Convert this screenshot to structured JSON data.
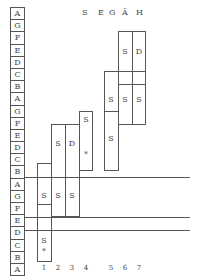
{
  "header": {
    "letters": [
      "S",
      "E",
      "G",
      "Ā",
      "H"
    ]
  },
  "pitch_labels": [
    "A",
    "G",
    "F",
    "E",
    "D",
    "C",
    "B",
    "A",
    "G",
    "F",
    "E",
    "D",
    "C",
    "B",
    "A",
    "G",
    "F",
    "E",
    "D",
    "C",
    "B",
    "A",
    "G",
    "F",
    "E",
    "D",
    "C"
  ],
  "rows_visible": [
    "A",
    "G",
    "F",
    "E",
    "D",
    "C",
    "B",
    "A",
    "G",
    "F",
    "E",
    "D",
    "C",
    "B",
    "A",
    "G",
    "F",
    "E",
    "D",
    "C"
  ],
  "columns": [
    {
      "number": "1",
      "cells": [
        {
          "text": "S"
        },
        {
          "text": "S"
        },
        {
          "text": "*"
        }
      ]
    },
    {
      "number": "2",
      "cells": [
        {
          "text": "S"
        },
        {
          "text": "S"
        }
      ]
    },
    {
      "number": "3",
      "cells": [
        {
          "text": "D"
        },
        {
          "text": "S"
        }
      ]
    },
    {
      "number": "4",
      "cells": [
        {
          "text": "S"
        },
        {
          "text": "*"
        }
      ]
    },
    {
      "number": "5",
      "cells": [
        {
          "text": "S"
        },
        {
          "text": "S"
        }
      ]
    },
    {
      "number": "6",
      "cells": [
        {
          "text": "S"
        },
        {
          "text": "S"
        }
      ]
    },
    {
      "number": "7",
      "cells": [
        {
          "text": "D"
        },
        {
          "text": "S"
        }
      ]
    }
  ],
  "colors": {
    "line": "#555555",
    "text": "#444444",
    "background": "#ffffff"
  }
}
